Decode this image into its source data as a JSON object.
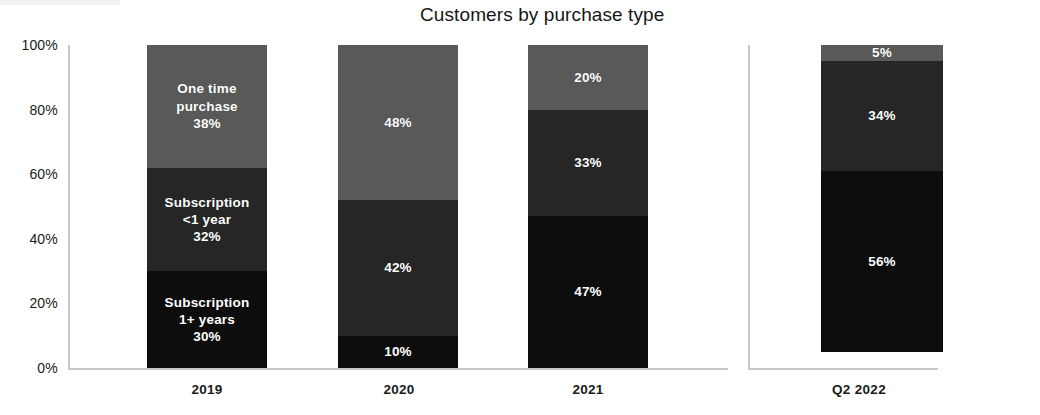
{
  "chart_data": {
    "type": "bar",
    "variant": "stacked-100-percent",
    "title": "Customers by purchase type",
    "xlabel": "",
    "ylabel": "",
    "ylim": [
      0,
      100
    ],
    "yticks": [
      "0%",
      "20%",
      "40%",
      "60%",
      "80%",
      "100%"
    ],
    "ytick_values": [
      0,
      20,
      40,
      60,
      80,
      100
    ],
    "grid": false,
    "legend": "inline-labels-on-first-bar",
    "categories": [
      "2019",
      "2020",
      "2021",
      "Q2 2022"
    ],
    "series": [
      {
        "name": "Subscription 1+ years",
        "color": "#0d0d0d",
        "values": [
          30,
          10,
          47,
          56
        ],
        "labels": [
          "30%",
          "10%",
          "47%",
          "56%"
        ]
      },
      {
        "name": "Subscription <1 year",
        "color": "#262626",
        "values": [
          32,
          42,
          33,
          34
        ],
        "labels": [
          "32%",
          "42%",
          "33%",
          "34%"
        ]
      },
      {
        "name": "One time purchase",
        "color": "#595959",
        "values": [
          38,
          48,
          20,
          5
        ],
        "labels": [
          "38%",
          "48%",
          "20%",
          "5%"
        ]
      }
    ],
    "inline_series_labels": {
      "one_time_purchase": "One time\npurchase",
      "subscription_under_1_year": "Subscription\n<1 year",
      "subscription_1_plus_years": "Subscription\n1+ years"
    }
  },
  "title": "Customers by purchase type",
  "axis": {
    "y": {
      "ticks": [
        {
          "label": "100%",
          "value": 100
        },
        {
          "label": "80%",
          "value": 80
        },
        {
          "label": "60%",
          "value": 60
        },
        {
          "label": "40%",
          "value": 40
        },
        {
          "label": "20%",
          "value": 20
        },
        {
          "label": "0%",
          "value": 0
        }
      ]
    },
    "x": {
      "ticks": [
        {
          "label": "2019"
        },
        {
          "label": "2020"
        },
        {
          "label": "2021"
        },
        {
          "label": "Q2 2022"
        }
      ]
    }
  },
  "bars": [
    {
      "category": "2019",
      "segments": [
        {
          "name": "One time purchase",
          "name_line1": "One time",
          "name_line2": "purchase",
          "value": 38,
          "label": "38%",
          "color": "#595959",
          "show_name": true
        },
        {
          "name": "Subscription <1 year",
          "name_line1": "Subscription",
          "name_line2": "<1 year",
          "value": 32,
          "label": "32%",
          "color": "#262626",
          "show_name": true
        },
        {
          "name": "Subscription 1+ years",
          "name_line1": "Subscription",
          "name_line2": "1+ years",
          "value": 30,
          "label": "30%",
          "color": "#0d0d0d",
          "show_name": true
        }
      ]
    },
    {
      "category": "2020",
      "segments": [
        {
          "name": "One time purchase",
          "value": 48,
          "label": "48%",
          "color": "#595959",
          "show_name": false
        },
        {
          "name": "Subscription <1 year",
          "value": 42,
          "label": "42%",
          "color": "#262626",
          "show_name": false
        },
        {
          "name": "Subscription 1+ years",
          "value": 10,
          "label": "10%",
          "color": "#0d0d0d",
          "show_name": false
        }
      ]
    },
    {
      "category": "2021",
      "segments": [
        {
          "name": "One time purchase",
          "value": 20,
          "label": "20%",
          "color": "#595959",
          "show_name": false
        },
        {
          "name": "Subscription <1 year",
          "value": 33,
          "label": "33%",
          "color": "#262626",
          "show_name": false
        },
        {
          "name": "Subscription 1+ years",
          "value": 47,
          "label": "47%",
          "color": "#0d0d0d",
          "show_name": false
        }
      ]
    },
    {
      "category": "Q2 2022",
      "segments": [
        {
          "name": "One time purchase",
          "value": 5,
          "label": "5%",
          "color": "#595959",
          "show_name": false
        },
        {
          "name": "Subscription <1 year",
          "value": 34,
          "label": "34%",
          "color": "#262626",
          "show_name": false
        },
        {
          "name": "Subscription 1+ years",
          "value": 56,
          "label": "56%",
          "color": "#0d0d0d",
          "show_name": false
        }
      ]
    }
  ],
  "colors": {
    "one_time_purchase": "#595959",
    "subscription_under_1_year": "#262626",
    "subscription_1_plus_years": "#0d0d0d",
    "axis": "#c9c9c9",
    "text": "#161616",
    "label_text": "#ffffff",
    "background": "#ffffff"
  }
}
